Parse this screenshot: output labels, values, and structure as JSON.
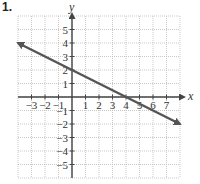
{
  "problem": {
    "number": "1."
  },
  "chart_data": {
    "type": "line",
    "title": "",
    "xlabel": "x",
    "ylabel": "y",
    "xlim": [
      -4,
      8
    ],
    "ylim": [
      -6,
      6
    ],
    "grid": true,
    "x_ticks": [
      -3,
      -2,
      -1,
      1,
      2,
      3,
      4,
      5,
      6,
      7
    ],
    "y_ticks": [
      5,
      4,
      3,
      2,
      1,
      -1,
      -2,
      -3,
      -4,
      -5
    ],
    "x_tick_labels": [
      "−3",
      "−2",
      "−1",
      "1",
      "2",
      "3",
      "4",
      "5",
      "6",
      "7"
    ],
    "y_tick_labels": [
      "5",
      "4",
      "3",
      "2",
      "1",
      "−1",
      "−2",
      "−3",
      "−4",
      "−5"
    ],
    "series": [
      {
        "name": "line",
        "equation": "y = -1/2 x + 2",
        "slope": -0.5,
        "y_intercept": 2,
        "x_intercept": 4,
        "points": [
          [
            -4,
            4
          ],
          [
            0,
            2
          ],
          [
            4,
            0
          ],
          [
            8,
            -2
          ]
        ],
        "arrows": "both",
        "color": "#555555"
      }
    ]
  }
}
